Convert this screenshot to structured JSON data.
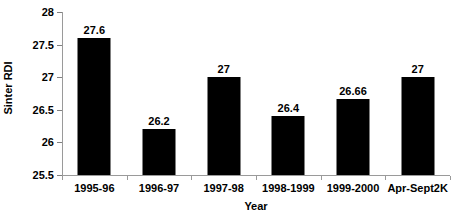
{
  "chart_data": {
    "type": "bar",
    "title": "",
    "subtitle": "",
    "xlabel": "Year",
    "ylabel": "Sinter RDI",
    "categories": [
      "1995-96",
      "1996-97",
      "1997-98",
      "1998-1999",
      "1999-2000",
      "Apr-Sept2K"
    ],
    "values": [
      27.6,
      26.2,
      27,
      26.4,
      26.66,
      27
    ],
    "data_labels": [
      "27.6",
      "26.2",
      "27",
      "26.4",
      "26.66",
      "27"
    ],
    "ylim": [
      25.5,
      28
    ],
    "ytick_step": 0.5,
    "ytick_labels": [
      "28",
      "27.5",
      "27",
      "26.5",
      "26",
      "25.5"
    ],
    "ytick_values": [
      28,
      27.5,
      27,
      26.5,
      26,
      25.5
    ],
    "grid": false,
    "legend": false,
    "legend_position": "none",
    "bar_color": "#000000",
    "axis_color": "#9a9a9a",
    "background_color": "#ffffff"
  }
}
